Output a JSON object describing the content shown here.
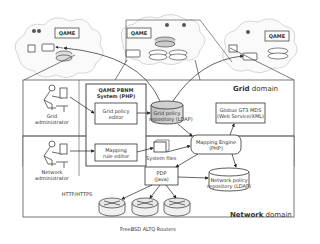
{
  "diagram": {
    "clouds": [
      {
        "id": "cloud-left",
        "label": "QAME"
      },
      {
        "id": "cloud-middle",
        "label": "QAME"
      },
      {
        "id": "cloud-right",
        "label": "QAME"
      }
    ],
    "actors": {
      "grid_admin": "Grid administrator",
      "grid_admin_line1": "Grid",
      "grid_admin_line2": "administrator",
      "network_admin_line1": "Network",
      "network_admin_line2": "administrator"
    },
    "system_box": {
      "title_line1": "QAME PBNM",
      "title_line2": "System (PHP)"
    },
    "nodes": {
      "grid_policy_editor_line1": "Grid policy",
      "grid_policy_editor_line2": "editor",
      "mapping_rule_editor_line1": "Mapping",
      "mapping_rule_editor_line2": "rule editor",
      "grid_policy_repo_line1": "Grid policy",
      "grid_policy_repo_line2": "repository (LDAP)",
      "globus_line1": "Globus GT3 MDS",
      "globus_line2": "(Web Service/XML)",
      "system_files": "System files",
      "mapping_engine_line1": "Mapping Engine",
      "mapping_engine_line2": "(PHP)",
      "pdp_line1": "PDP",
      "pdp_line2": "(Java)",
      "network_policy_repo_line1": "Network policy",
      "network_policy_repo_line2": "repository (LDAP)",
      "routers": "FreeBSD ALTQ Routers"
    },
    "protocol": "HTTP/HTTPS",
    "domains": {
      "grid_bold": "Grid",
      "grid_rest": " domain",
      "network_bold": "Network",
      "network_rest": " domain"
    }
  }
}
